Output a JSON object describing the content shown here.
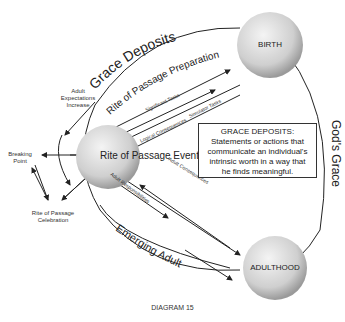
{
  "diagram": {
    "nodes": {
      "birth": "BIRTH",
      "rite": "Rite of Passage Event",
      "adulthood": "ADULTHOOD"
    },
    "arcs": {
      "grace_deposits": "Grace Deposits",
      "gods_grace": "God's Grace",
      "rite_prep": "Rite of Passage Preparation",
      "emerging_adult": "Emerging Adult"
    },
    "arrows": {
      "significant_tasks": "Significant Tasks",
      "simulator_tasks": "Simulator Tasks",
      "logical_consequences": "Logical Consequences",
      "adult_responsibilities": "Adult Responsibilities",
      "adult_consequences": "Adult Consequences"
    },
    "side_labels": {
      "adult_expectations": [
        "Adult",
        "Expectations",
        "Increase"
      ],
      "breaking_point": [
        "Breaking",
        "Point"
      ],
      "celebration": [
        "Rite of Passage",
        "Celebration"
      ]
    },
    "definition_box": {
      "title": "GRACE DEPOSITS:",
      "lines": [
        "Statements or actions that",
        "communicate an individual's",
        "intrinsic worth in a way that",
        "he finds meaningful."
      ]
    },
    "caption": "DIAGRAM 15"
  }
}
